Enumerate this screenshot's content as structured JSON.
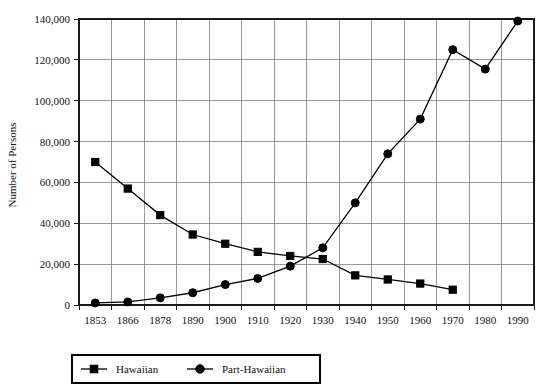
{
  "chart_data": {
    "type": "line",
    "title": "",
    "xlabel": "",
    "ylabel": "Number of Persons",
    "ylim": [
      0,
      140000
    ],
    "yticks": [
      0,
      20000,
      40000,
      60000,
      80000,
      100000,
      120000,
      140000
    ],
    "ytick_labels": [
      "0",
      "20,000",
      "40,000",
      "60,000",
      "80,000",
      "100,000",
      "120,000",
      "140,000"
    ],
    "categories": [
      "1853",
      "1866",
      "1878",
      "1890",
      "1900",
      "1910",
      "1920",
      "1930",
      "1940",
      "1950",
      "1960",
      "1970",
      "1980",
      "1990"
    ],
    "grid": true,
    "legend_position": "bottom",
    "series": [
      {
        "name": "Hawaiian",
        "marker": "square",
        "values": [
          70000,
          57000,
          44000,
          34500,
          30000,
          26000,
          24000,
          22500,
          14500,
          12500,
          10500,
          7500,
          null,
          null
        ]
      },
      {
        "name": "Part-Hawaiian",
        "marker": "circle",
        "values": [
          1000,
          1500,
          3500,
          6000,
          10000,
          13000,
          19000,
          28000,
          50000,
          74000,
          91000,
          125000,
          115500,
          139000
        ]
      }
    ]
  },
  "legend": {
    "items": [
      {
        "label": "Hawaiian",
        "marker": "square"
      },
      {
        "label": "Part-Hawaiian",
        "marker": "circle"
      }
    ]
  },
  "colors": {
    "series": "#000000",
    "grid": "#808080",
    "axis": "#1a1a1a",
    "background": "#ffffff"
  }
}
